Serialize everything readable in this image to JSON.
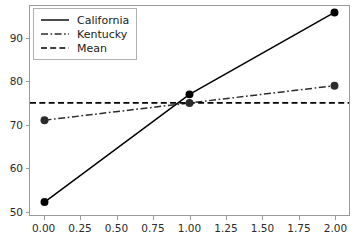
{
  "chart_data": {
    "type": "line",
    "title": "",
    "xlabel": "",
    "ylabel": "",
    "xlim": [
      -0.1,
      2.1
    ],
    "ylim": [
      49.0,
      97.5
    ],
    "grid": false,
    "legend_position": "upper left",
    "x": [
      0.0,
      1.0,
      2.0
    ],
    "xticks": [
      "0.00",
      "0.25",
      "0.50",
      "0.75",
      "1.00",
      "1.25",
      "1.50",
      "1.75",
      "2.00"
    ],
    "xtick_values": [
      0.0,
      0.25,
      0.5,
      0.75,
      1.0,
      1.25,
      1.5,
      1.75,
      2.0
    ],
    "yticks": [
      "50",
      "60",
      "70",
      "80",
      "90"
    ],
    "ytick_values": [
      50,
      60,
      70,
      80,
      90
    ],
    "series": [
      {
        "name": "California",
        "values": [
          52,
          77,
          96
        ],
        "linestyle": "solid",
        "marker": "circle",
        "color": "#000000"
      },
      {
        "name": "Kentucky",
        "values": [
          71,
          75,
          79
        ],
        "linestyle": "dashdot",
        "marker": "circle",
        "color": "#2b2b2b"
      },
      {
        "name": "Mean",
        "values": [
          75,
          75,
          75
        ],
        "linestyle": "dashed",
        "marker": "none",
        "color": "#000000"
      }
    ],
    "annotations": []
  },
  "legend": {
    "entries": [
      {
        "label": "California"
      },
      {
        "label": "Kentucky"
      },
      {
        "label": "Mean"
      }
    ]
  }
}
